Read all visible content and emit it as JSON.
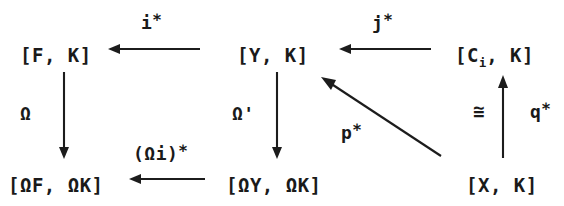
{
  "diagram": {
    "type": "commutative-diagram",
    "background_color": "#ffffff",
    "ink_color": "#1c1c1c",
    "nodes": [
      {
        "id": "F_K",
        "label_prefix": "[F, K]",
        "label_sub": "",
        "label_suffix": "",
        "x": 20,
        "y": 46
      },
      {
        "id": "Y_K",
        "label_prefix": "[Y, K]",
        "label_sub": "",
        "label_suffix": "",
        "x": 237,
        "y": 46
      },
      {
        "id": "Ci_K",
        "label_prefix": "[C",
        "label_sub": "i",
        "label_suffix": ", K]",
        "x": 455,
        "y": 46
      },
      {
        "id": "OF_OK",
        "label_prefix": "[ΩF, ΩK]",
        "label_sub": "",
        "label_suffix": "",
        "x": 8,
        "y": 176
      },
      {
        "id": "OY_OK",
        "label_prefix": "[ΩY, ΩK]",
        "label_sub": "",
        "label_suffix": "",
        "x": 226,
        "y": 176
      },
      {
        "id": "X_K",
        "label_prefix": "[X, K]",
        "label_sub": "",
        "label_suffix": "",
        "x": 466,
        "y": 176
      }
    ],
    "arrows": [
      {
        "id": "i_star",
        "from": "Y_K",
        "to": "F_K",
        "direction": "left",
        "x1": 200,
        "y1": 49,
        "x2": 110,
        "y2": 49
      },
      {
        "id": "j_star",
        "from": "Ci_K",
        "to": "Y_K",
        "direction": "left",
        "x1": 431,
        "y1": 49,
        "x2": 341,
        "y2": 49
      },
      {
        "id": "omega",
        "from": "F_K",
        "to": "OF_OK",
        "direction": "down",
        "x1": 64,
        "y1": 72,
        "x2": 64,
        "y2": 157
      },
      {
        "id": "omega_prime",
        "from": "Y_K",
        "to": "OY_OK",
        "direction": "down",
        "x1": 277,
        "y1": 72,
        "x2": 277,
        "y2": 157
      },
      {
        "id": "omega_i_star",
        "from": "OY_OK",
        "to": "OF_OK",
        "direction": "left",
        "x1": 205,
        "y1": 179,
        "x2": 131,
        "y2": 179
      },
      {
        "id": "q_star",
        "from": "X_K",
        "to": "Ci_K",
        "direction": "up",
        "x1": 503,
        "y1": 158,
        "x2": 503,
        "y2": 76
      },
      {
        "id": "p_star",
        "from": "X_K",
        "to": "Y_K",
        "direction": "diagonal-up-left",
        "x1": 441,
        "y1": 156,
        "x2": 323,
        "y2": 79
      }
    ],
    "labels": [
      {
        "id": "label_i_star",
        "for": "i_star",
        "text": "i",
        "star": "∗",
        "x": 141,
        "y": 14
      },
      {
        "id": "label_j_star",
        "for": "j_star",
        "text": "j",
        "star": "∗",
        "x": 372,
        "y": 14
      },
      {
        "id": "label_omega",
        "for": "omega",
        "text": "Ω",
        "star": "",
        "x": 20,
        "y": 105
      },
      {
        "id": "label_omega_prime",
        "for": "omega_prime",
        "text": "Ω'",
        "star": "",
        "x": 232,
        "y": 105
      },
      {
        "id": "label_omega_i_star",
        "for": "omega_i_star",
        "text": "(Ωi)",
        "star": "∗",
        "x": 133,
        "y": 145
      },
      {
        "id": "label_p_star",
        "for": "p_star",
        "text": "p",
        "star": "∗",
        "x": 341,
        "y": 124
      },
      {
        "id": "label_q_star",
        "for": "q_star",
        "text": "q",
        "star": "∗",
        "x": 530,
        "y": 103
      }
    ],
    "iso_marker": {
      "id": "iso_congruent",
      "symbol": "≅",
      "for": "q_star",
      "x": 473,
      "y": 102
    }
  }
}
